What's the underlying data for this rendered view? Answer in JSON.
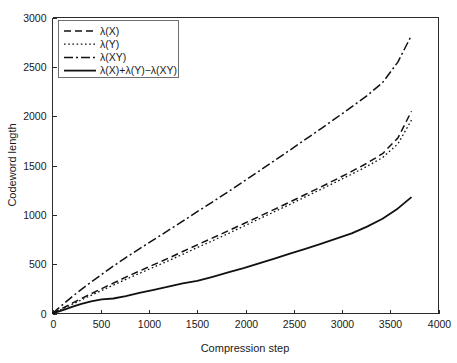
{
  "figure": {
    "background_color": "#ffffff",
    "axis_color": "#2b2b2b",
    "line_color": "#111111",
    "legend_border_color": "#6f6f6f"
  },
  "chart_data": {
    "type": "line",
    "title": "",
    "xlabel": "Compression step",
    "ylabel": "Codeword length",
    "xlim": [
      0,
      4000
    ],
    "ylim": [
      0,
      3000
    ],
    "xticks": [
      0,
      500,
      1000,
      1500,
      2000,
      2500,
      3000,
      3500,
      4000
    ],
    "yticks": [
      0,
      500,
      1000,
      1500,
      2000,
      2500,
      3000
    ],
    "xtick_labels": [
      "0",
      "500",
      "1000",
      "1500",
      "2000",
      "2500",
      "3000",
      "3500",
      "4000"
    ],
    "ytick_labels": [
      "0",
      "500",
      "1000",
      "1500",
      "2000",
      "2500",
      "3000"
    ],
    "grid": false,
    "legend_position": "upper left",
    "series": [
      {
        "name": "λ(X)",
        "style": "dashed",
        "dasharray": "7,4",
        "width": 1.5,
        "x": [
          0,
          60,
          130,
          210,
          300,
          400,
          510,
          630,
          760,
          900,
          1050,
          1200,
          1350,
          1500,
          1660,
          1820,
          1980,
          2140,
          2300,
          2460,
          2620,
          2780,
          2940,
          3100,
          3260,
          3420,
          3580,
          3720
        ],
        "y": [
          0,
          30,
          66,
          108,
          152,
          200,
          252,
          308,
          368,
          430,
          495,
          560,
          628,
          696,
          766,
          838,
          910,
          982,
          1056,
          1130,
          1206,
          1282,
          1360,
          1440,
          1524,
          1620,
          1780,
          2050
        ]
      },
      {
        "name": "λ(Y)",
        "style": "dotted",
        "dasharray": "1.6,2.6",
        "width": 1.3,
        "x": [
          0,
          60,
          130,
          210,
          300,
          400,
          510,
          630,
          760,
          900,
          1050,
          1200,
          1350,
          1500,
          1660,
          1820,
          1980,
          2140,
          2300,
          2460,
          2620,
          2780,
          2940,
          3100,
          3260,
          3420,
          3580,
          3720
        ],
        "y": [
          0,
          26,
          58,
          96,
          138,
          184,
          234,
          288,
          346,
          406,
          470,
          534,
          600,
          668,
          738,
          810,
          884,
          958,
          1032,
          1106,
          1182,
          1258,
          1334,
          1412,
          1492,
          1580,
          1720,
          1960
        ]
      },
      {
        "name": "λ(XY)",
        "style": "dashdot",
        "dasharray": "9,3,2,3",
        "width": 1.5,
        "x": [
          0,
          60,
          130,
          210,
          300,
          400,
          510,
          630,
          760,
          900,
          1050,
          1200,
          1350,
          1500,
          1660,
          1820,
          1980,
          2140,
          2300,
          2460,
          2620,
          2780,
          2940,
          3100,
          3260,
          3420,
          3580,
          3720
        ],
        "y": [
          0,
          52,
          110,
          176,
          244,
          318,
          396,
          480,
          566,
          656,
          748,
          842,
          936,
          1032,
          1132,
          1234,
          1338,
          1444,
          1550,
          1656,
          1764,
          1872,
          1982,
          2094,
          2208,
          2340,
          2550,
          2820
        ]
      },
      {
        "name": "λ(X)+λ(Y)−λ(XY)",
        "style": "solid",
        "dasharray": "",
        "width": 1.8,
        "x": [
          0,
          60,
          130,
          210,
          300,
          400,
          510,
          630,
          760,
          900,
          1050,
          1200,
          1350,
          1500,
          1660,
          1820,
          1980,
          2140,
          2300,
          2460,
          2620,
          2780,
          2940,
          3100,
          3260,
          3420,
          3580,
          3720
        ],
        "y": [
          0,
          18,
          42,
          70,
          98,
          124,
          144,
          152,
          176,
          208,
          240,
          272,
          306,
          330,
          372,
          416,
          460,
          508,
          556,
          606,
          656,
          706,
          758,
          812,
          880,
          960,
          1065,
          1180
        ]
      }
    ]
  },
  "legend": {
    "entries": [
      {
        "label": "λ(X)"
      },
      {
        "label": "λ(Y)"
      },
      {
        "label": "λ(XY)"
      },
      {
        "label": "λ(X)+λ(Y)−λ(XY)"
      }
    ]
  }
}
